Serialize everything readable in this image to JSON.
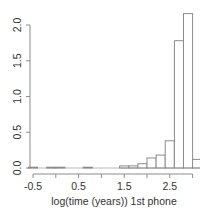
{
  "chart_data": {
    "type": "bar",
    "subtype": "histogram",
    "title": "",
    "xlabel": "log(time (years)) 1st phone",
    "ylabel": "",
    "xlim": [
      -0.6,
      3.2
    ],
    "ylim": [
      0,
      2.2
    ],
    "grid": false,
    "legend": null,
    "x_ticks": [
      -0.5,
      0.0,
      0.5,
      1.0,
      1.5,
      2.0,
      2.5,
      3.0
    ],
    "x_tick_labels": [
      "-0.5",
      "",
      "0.5",
      "",
      "1.5",
      "",
      "2.5",
      ""
    ],
    "y_ticks": [
      0.0,
      0.5,
      1.0,
      1.5,
      2.0
    ],
    "y_tick_labels": [
      "0.0",
      "0.5",
      "1.0",
      "1.5",
      "2.0"
    ],
    "bin_width": 0.2,
    "bins": [
      {
        "x0": -0.6,
        "x1": -0.4,
        "density": 0.01
      },
      {
        "x0": -0.4,
        "x1": -0.2,
        "density": 0.0
      },
      {
        "x0": -0.2,
        "x1": 0.0,
        "density": 0.01
      },
      {
        "x0": 0.0,
        "x1": 0.2,
        "density": 0.01
      },
      {
        "x0": 0.2,
        "x1": 0.4,
        "density": 0.0
      },
      {
        "x0": 0.4,
        "x1": 0.6,
        "density": 0.0
      },
      {
        "x0": 0.6,
        "x1": 0.8,
        "density": 0.01
      },
      {
        "x0": 0.8,
        "x1": 1.0,
        "density": 0.0
      },
      {
        "x0": 1.0,
        "x1": 1.2,
        "density": 0.0
      },
      {
        "x0": 1.2,
        "x1": 1.4,
        "density": 0.0
      },
      {
        "x0": 1.4,
        "x1": 1.6,
        "density": 0.03
      },
      {
        "x0": 1.6,
        "x1": 1.8,
        "density": 0.03
      },
      {
        "x0": 1.8,
        "x1": 2.0,
        "density": 0.06
      },
      {
        "x0": 2.0,
        "x1": 2.2,
        "density": 0.14
      },
      {
        "x0": 2.2,
        "x1": 2.4,
        "density": 0.18
      },
      {
        "x0": 2.4,
        "x1": 2.6,
        "density": 0.38
      },
      {
        "x0": 2.6,
        "x1": 2.8,
        "density": 1.78
      },
      {
        "x0": 2.8,
        "x1": 3.0,
        "density": 2.16
      },
      {
        "x0": 3.0,
        "x1": 3.2,
        "density": 0.12
      }
    ],
    "colors": {
      "bar_fill": "#ffffff",
      "bar_stroke": "#8c8c8c",
      "axis": "#8c8c8c",
      "text": "#333333"
    }
  }
}
